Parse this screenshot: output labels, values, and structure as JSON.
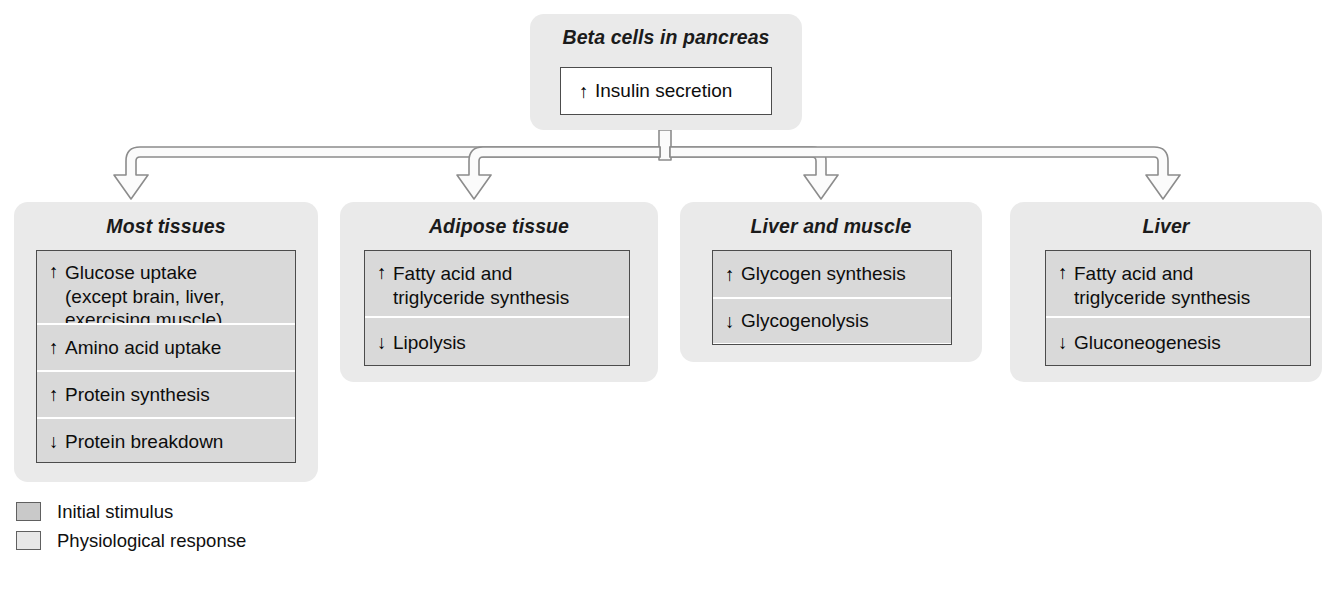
{
  "diagram": {
    "top_node": {
      "header": "Beta cells in pancreas",
      "effect_arrow": "↑",
      "effect": "Insulin secretion"
    },
    "targets": [
      {
        "header": "Most tissues",
        "effects": [
          {
            "arrow": "↑",
            "text": "Glucose uptake\n(except brain, liver,\nexercising muscle)"
          },
          {
            "arrow": "↑",
            "text": "Amino acid uptake"
          },
          {
            "arrow": "↑",
            "text": "Protein synthesis"
          },
          {
            "arrow": "↓",
            "text": "Protein breakdown"
          }
        ]
      },
      {
        "header": "Adipose tissue",
        "effects": [
          {
            "arrow": "↑",
            "text": "Fatty acid and\ntriglyceride synthesis"
          },
          {
            "arrow": "↓",
            "text": "Lipolysis"
          }
        ]
      },
      {
        "header": "Liver and muscle",
        "effects": [
          {
            "arrow": "↑",
            "text": "Glycogen synthesis"
          },
          {
            "arrow": "↓",
            "text": "Glycogenolysis"
          }
        ]
      },
      {
        "header": "Liver",
        "effects": [
          {
            "arrow": "↑",
            "text": "Fatty acid and\ntriglyceride synthesis"
          },
          {
            "arrow": "↓",
            "text": "Gluconeogenesis"
          }
        ]
      }
    ]
  },
  "legend": {
    "items": [
      {
        "label": "Initial stimulus",
        "color": "#c9c9c9"
      },
      {
        "label": "Physiological response",
        "color": "#e8e8e8"
      }
    ]
  },
  "colors": {
    "panel_background": "#eaeaea",
    "row_background": "#d9d9d9",
    "box_border": "#4c4c4c",
    "connector_stroke": "#8c8c8c",
    "connector_fill": "#fbfbfb",
    "text": "#000000"
  }
}
